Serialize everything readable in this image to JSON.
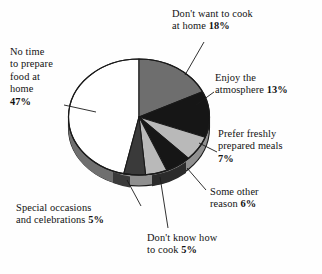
{
  "chart_data": {
    "type": "pie",
    "title": "",
    "subtitle": "",
    "xlabel": "",
    "ylabel": "",
    "legend_position": "none",
    "grid": false,
    "style": "3d-exploded-none",
    "categories": [
      "Don't want to cook at home",
      "Enjoy the atmosphere",
      "Prefer freshly prepared meals",
      "Some other reason",
      "Don't know how to cook",
      "Special occasions and celebrations",
      "No time to prepare food at home"
    ],
    "values": [
      18,
      13,
      7,
      6,
      5,
      5,
      47
    ],
    "value_unit": "%",
    "slice_colors": [
      "#6e6e6e",
      "#161616",
      "#b9b9b9",
      "#161616",
      "#b9b9b9",
      "#3a3a3a",
      "#ffffff"
    ],
    "slices": [
      {
        "label": "Don't want to cook at home",
        "value": 18,
        "display": "18%",
        "color": "#6e6e6e"
      },
      {
        "label": "Enjoy the atmosphere",
        "value": 13,
        "display": "13%",
        "color": "#161616"
      },
      {
        "label": "Prefer freshly prepared meals",
        "value": 7,
        "display": "7%",
        "color": "#b9b9b9"
      },
      {
        "label": "Some other reason",
        "value": 6,
        "display": "6%",
        "color": "#161616"
      },
      {
        "label": "Don't know how to cook",
        "value": 5,
        "display": "5%",
        "color": "#b9b9b9"
      },
      {
        "label": "Special occasions and celebrations",
        "value": 5,
        "display": "5%",
        "color": "#3a3a3a"
      },
      {
        "label": "No time to prepare food at home",
        "value": 47,
        "display": "47%",
        "color": "#ffffff"
      }
    ],
    "total": 101
  },
  "labels": {
    "dont_want": {
      "line1": "Don't want to cook",
      "line2": "at home ",
      "pct": "18%"
    },
    "enjoy": {
      "line1": "Enjoy the",
      "line2": "atmosphere ",
      "pct": "13%"
    },
    "prefer": {
      "line1": "Prefer freshly",
      "line2": "prepared meals",
      "pct": "7%"
    },
    "some_other": {
      "line1": "Some other",
      "line2": "reason ",
      "pct": "6%"
    },
    "dont_know": {
      "line1": "Don't know how",
      "line2": "to cook ",
      "pct": "5%"
    },
    "special": {
      "line1": "Special occasions",
      "line2": "and celebrations ",
      "pct": "5%"
    },
    "no_time": {
      "line1": "No time",
      "line2": "to prepare",
      "line3": "food at",
      "line4": "home",
      "pct": "47%"
    }
  },
  "colors": {
    "background": "#fefefe",
    "outline": "#1a1a1a",
    "rim": "#909090",
    "rim_shadow": "#5f5f5f",
    "leader_line": "#1a1a1a",
    "text": "#121212"
  }
}
